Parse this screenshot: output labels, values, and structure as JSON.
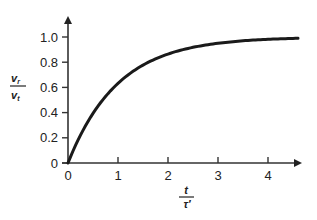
{
  "chart_data": {
    "type": "line",
    "title": "",
    "xlabel": "t / τ′",
    "ylabel": "v_r / v_t",
    "xlabel_parts": {
      "numerator": "t",
      "denominator": "τ′"
    },
    "ylabel_parts": {
      "numerator": "v",
      "numerator_sub": "r",
      "denominator": "v",
      "denominator_sub": "t"
    },
    "x_ticks": [
      "0",
      "1",
      "2",
      "3",
      "4"
    ],
    "y_ticks": [
      "0",
      "0.2",
      "0.4",
      "0.6",
      "0.8",
      "1.0"
    ],
    "xlim": [
      0,
      4.6
    ],
    "ylim": [
      0,
      1.15
    ],
    "grid": false,
    "legend": null,
    "series": [
      {
        "name": "v_r/v_t = 1 - e^(-t/τ′)",
        "x": [
          0,
          0.25,
          0.5,
          0.75,
          1.0,
          1.25,
          1.5,
          1.75,
          2.0,
          2.5,
          3.0,
          3.5,
          4.0,
          4.5
        ],
        "y": [
          0,
          0.22,
          0.39,
          0.53,
          0.63,
          0.71,
          0.78,
          0.83,
          0.86,
          0.92,
          0.95,
          0.97,
          0.98,
          0.99
        ]
      }
    ]
  }
}
